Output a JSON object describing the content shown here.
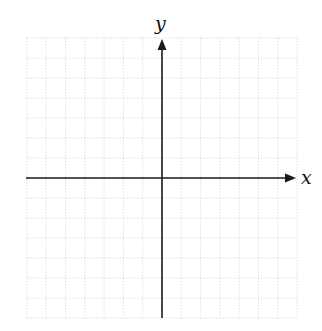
{
  "diagram": {
    "type": "cartesian-coordinate-plane",
    "x_axis_label": "x",
    "y_axis_label": "y",
    "grid": {
      "cells_left_of_origin": 7,
      "cells_right_of_origin": 7,
      "cells_above_origin": 7,
      "cells_below_origin": 7,
      "line_style": "dotted",
      "line_color": "#d6d6d6"
    },
    "axis_color": "#1a1a1a",
    "arrows": [
      "positive-x",
      "positive-y"
    ]
  }
}
